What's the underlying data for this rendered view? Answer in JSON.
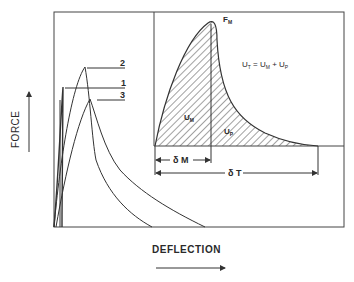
{
  "diagram": {
    "y_axis_label": "FORCE",
    "x_axis_label": "DEFLECTION",
    "curve_labels": [
      "2",
      "1",
      "3"
    ],
    "inset": {
      "peak_label": "F",
      "peak_sub": "M",
      "equation": {
        "lhs": "U",
        "lhs_sub": "T",
        "eq": " = ",
        "t1": "U",
        "t1_sub": "M",
        "plus": " + ",
        "t2": "U",
        "t2_sub": "P"
      },
      "area_m": "U",
      "area_m_sub": "M",
      "area_p": "U",
      "area_p_sub": "P",
      "delta_m": "δ M",
      "delta_t": "δ T"
    },
    "colors": {
      "line": "#333333",
      "background": "#ffffff"
    }
  }
}
